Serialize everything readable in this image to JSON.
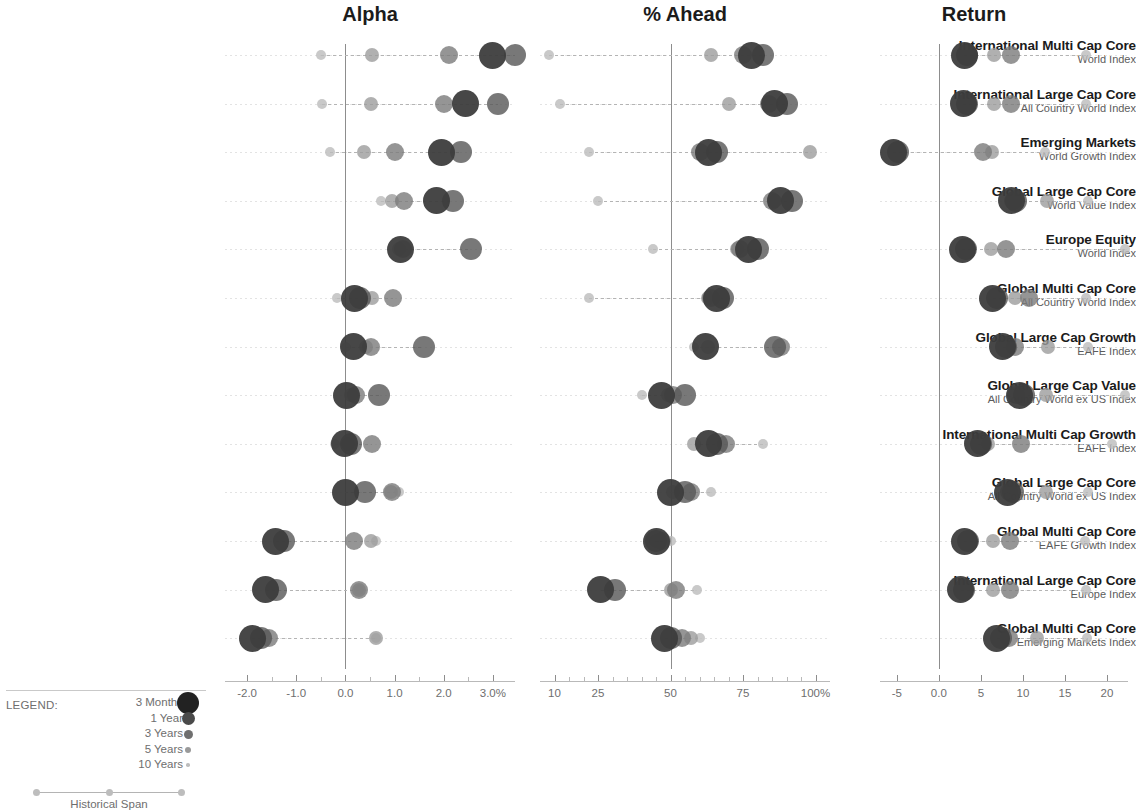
{
  "panels": [
    {
      "key": "alpha",
      "title": "Alpha"
    },
    {
      "key": "ahead",
      "title": "% Ahead"
    },
    {
      "key": "return",
      "title": "Return"
    }
  ],
  "legend": {
    "caption": "LEGEND:",
    "span_caption": "Historical Span",
    "items": [
      {
        "label": "3 Months",
        "r": 11,
        "color": "#222222"
      },
      {
        "label": "1 Year",
        "r": 6.5,
        "color": "#4a4a4a"
      },
      {
        "label": "3 Years",
        "r": 4.5,
        "color": "#6f6f6f"
      },
      {
        "label": "5 Years",
        "r": 3.0,
        "color": "#9a9a9a"
      },
      {
        "label": "10 Years",
        "r": 1.8,
        "color": "#bdbdbd"
      }
    ]
  },
  "series_styles": [
    {
      "name": "3 Months",
      "r": 13.5,
      "color": "#3b3b3b"
    },
    {
      "name": "1 Year",
      "r": 11.0,
      "color": "#565656"
    },
    {
      "name": "3 Years",
      "r": 9.0,
      "color": "#7b7b7b"
    },
    {
      "name": "5 Years",
      "r": 7.0,
      "color": "#9c9c9c"
    },
    {
      "name": "10 Years",
      "r": 5.0,
      "color": "#bcbcbc"
    }
  ],
  "chart_data": {
    "type": "scatter",
    "title": "",
    "legend_position": "bottom-left",
    "grid": false,
    "series_names": [
      "3 Months",
      "1 Year",
      "3 Years",
      "5 Years",
      "10 Years"
    ],
    "categories": [
      {
        "name": "International Multi Cap Core",
        "benchmark": "World Index"
      },
      {
        "name": "International Large Cap Core",
        "benchmark": "All Country World Index"
      },
      {
        "name": "Emerging Markets",
        "benchmark": "World Growth Index"
      },
      {
        "name": "Global Large Cap Core",
        "benchmark": "World Value Index"
      },
      {
        "name": "Europe Equity",
        "benchmark": "World Index"
      },
      {
        "name": "Global Multi Cap Core",
        "benchmark": "All Country World Index"
      },
      {
        "name": "Global Large Cap Growth",
        "benchmark": "EAFE Index"
      },
      {
        "name": "Global Large Cap Value",
        "benchmark": "All Country World ex US Index"
      },
      {
        "name": "International Multi Cap Growth",
        "benchmark": "EAFE Index"
      },
      {
        "name": "Global Large Cap Core",
        "benchmark": "All Country World ex US Index"
      },
      {
        "name": "Global Multi Cap Core",
        "benchmark": "EAFE Growth Index"
      },
      {
        "name": "International Large Cap Core",
        "benchmark": "Europe Index"
      },
      {
        "name": "Global Multi Cap Core",
        "benchmark": "Emerging Markets Index"
      }
    ],
    "panels": [
      {
        "key": "alpha",
        "title": "Alpha",
        "xlabel": "",
        "xlim": [
          -2.45,
          3.45
        ],
        "ticks": [
          {
            "v": -2.0,
            "label": "-2.0",
            "major": true
          },
          {
            "v": -1.0,
            "label": "-1.0",
            "major": true
          },
          {
            "v": 0.0,
            "label": "0.0",
            "major": true
          },
          {
            "v": 1.0,
            "label": "1.0",
            "major": true
          },
          {
            "v": 2.0,
            "label": "2.0",
            "major": true
          },
          {
            "v": 3.0,
            "label": "3.0%",
            "major": true
          }
        ],
        "minor_ticks": [
          -1.5,
          -0.5,
          0.5,
          1.5,
          2.5
        ],
        "zero": 0.0,
        "rows": [
          {
            "values": [
              3.0,
              3.45,
              2.1,
              0.55,
              -0.5
            ]
          },
          {
            "values": [
              2.45,
              3.1,
              2.0,
              0.52,
              -0.48
            ]
          },
          {
            "values": [
              1.95,
              2.35,
              1.0,
              0.38,
              -0.32
            ]
          },
          {
            "values": [
              1.85,
              2.18,
              1.2,
              0.95,
              0.72
            ]
          },
          {
            "values": [
              1.12,
              2.55,
              1.18,
              1.1,
              1.1
            ]
          },
          {
            "values": [
              0.18,
              0.3,
              0.96,
              0.55,
              -0.18
            ]
          },
          {
            "values": [
              0.16,
              1.6,
              0.52,
              0.42,
              0.02
            ]
          },
          {
            "values": [
              0.02,
              0.68,
              0.22,
              0.12,
              0.12
            ]
          },
          {
            "values": [
              -0.02,
              0.12,
              0.55,
              0.06,
              -0.22
            ]
          },
          {
            "values": [
              0.0,
              0.4,
              0.95,
              0.92,
              1.1
            ]
          },
          {
            "values": [
              -1.42,
              -1.25,
              0.18,
              0.52,
              0.62
            ]
          },
          {
            "values": [
              -1.62,
              -1.42,
              0.28,
              0.28,
              0.28
            ]
          },
          {
            "values": [
              -1.9,
              -1.72,
              -1.55,
              0.62,
              0.62
            ]
          }
        ]
      },
      {
        "key": "ahead",
        "title": "% Ahead",
        "xlabel": "",
        "xlim": [
          5,
          105
        ],
        "ticks": [
          {
            "v": 10,
            "label": "10",
            "major": true
          },
          {
            "v": 25,
            "label": "25",
            "major": true
          },
          {
            "v": 50,
            "label": "50",
            "major": true
          },
          {
            "v": 75,
            "label": "75",
            "major": true
          },
          {
            "v": 100,
            "label": "100%",
            "major": true
          }
        ],
        "minor_ticks": [
          15,
          20,
          30,
          35,
          40,
          45,
          55,
          60,
          65,
          70,
          80,
          85,
          90,
          95
        ],
        "zero": 50,
        "rows": [
          {
            "values": [
              78,
              82,
              75,
              64,
              8
            ]
          },
          {
            "values": [
              86,
              90,
              84,
              70,
              12
            ]
          },
          {
            "values": [
              63,
              66,
              60,
              98,
              22
            ]
          },
          {
            "values": [
              88,
              92,
              85,
              86,
              25
            ]
          },
          {
            "values": [
              77,
              80,
              74,
              73,
              44
            ]
          },
          {
            "values": [
              66,
              68,
              64,
              63,
              22
            ]
          },
          {
            "values": [
              62,
              86,
              88,
              63,
              58
            ]
          },
          {
            "values": [
              47,
              55,
              51,
              49,
              40
            ]
          },
          {
            "values": [
              63,
              66,
              69,
              58,
              82
            ]
          },
          {
            "values": [
              50,
              55,
              57,
              51,
              64
            ]
          },
          {
            "values": [
              45,
              45,
              47,
              45,
              50
            ]
          },
          {
            "values": [
              26,
              31,
              52,
              50,
              59
            ]
          },
          {
            "values": [
              48,
              50,
              54,
              57,
              60
            ]
          }
        ]
      },
      {
        "key": "return",
        "title": "Return",
        "xlabel": "",
        "xlim": [
          -7.0,
          22.5
        ],
        "ticks": [
          {
            "v": -5,
            "label": "-5",
            "major": true
          },
          {
            "v": 0,
            "label": "0.0",
            "major": true
          },
          {
            "v": 5,
            "label": "5",
            "major": true
          },
          {
            "v": 10,
            "label": "10",
            "major": true
          },
          {
            "v": 15,
            "label": "15",
            "major": true
          },
          {
            "v": 20,
            "label": "20",
            "major": true
          }
        ],
        "minor_ticks": [],
        "zero": 0,
        "rows": [
          {
            "values": [
              3.0,
              3.4,
              8.6,
              6.6,
              17.5
            ]
          },
          {
            "values": [
              2.9,
              3.4,
              8.6,
              6.6,
              17.5
            ]
          },
          {
            "values": [
              -5.4,
              -4.9,
              5.3,
              6.3,
              12.6
            ]
          },
          {
            "values": [
              8.6,
              9.2,
              8.8,
              12.9,
              17.7
            ]
          },
          {
            "values": [
              2.8,
              3.2,
              8.0,
              6.2,
              22.2
            ]
          },
          {
            "values": [
              6.4,
              6.9,
              10.7,
              9.0,
              17.5
            ]
          },
          {
            "values": [
              7.6,
              8.0,
              9.0,
              13.0,
              17.7
            ]
          },
          {
            "values": [
              9.6,
              10.1,
              9.2,
              12.7,
              22.1
            ]
          },
          {
            "values": [
              4.6,
              5.0,
              9.8,
              5.9,
              20.6
            ]
          },
          {
            "values": [
              8.2,
              8.8,
              8.4,
              12.8,
              17.7
            ]
          },
          {
            "values": [
              3.0,
              3.5,
              8.5,
              6.5,
              17.4
            ]
          },
          {
            "values": [
              2.6,
              3.0,
              8.5,
              6.4,
              17.5
            ]
          },
          {
            "values": [
              6.9,
              7.4,
              8.4,
              11.7,
              17.6
            ]
          }
        ]
      }
    ]
  }
}
